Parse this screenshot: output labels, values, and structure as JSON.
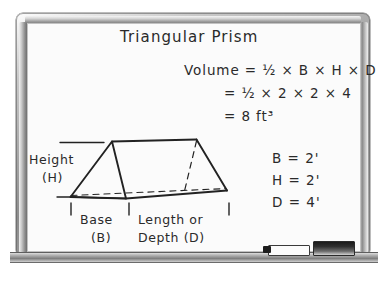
{
  "board": {
    "title": "Triangular Prism",
    "formula": {
      "line1": "Volume = ½ × B × H × D",
      "line2": "= ½ × 2 × 2 × 4",
      "line3": "= 8 ft³"
    },
    "variables": [
      {
        "name": "B",
        "value": "B = 2'"
      },
      {
        "name": "H",
        "value": "H = 2'"
      },
      {
        "name": "D",
        "value": "D = 4'"
      }
    ],
    "diagram_labels": {
      "height_line1": "Height",
      "height_line2": "(H)",
      "base_line1": "Base",
      "base_line2": "(B)",
      "length_line1": "Length or",
      "length_line2": "Depth (D)"
    },
    "colors": {
      "ink": "#2a2a2a",
      "board_surface": "#fbfbfb",
      "frame_light": "#e6e6e6",
      "frame_dark": "#7e7e7e",
      "marker_body": "#fbfbfb",
      "marker_cap": "#1d1d1d",
      "eraser": "#2f2f2f"
    }
  },
  "tray": {
    "marker_label": "whiteboard-marker",
    "eraser_label": "whiteboard-eraser"
  }
}
